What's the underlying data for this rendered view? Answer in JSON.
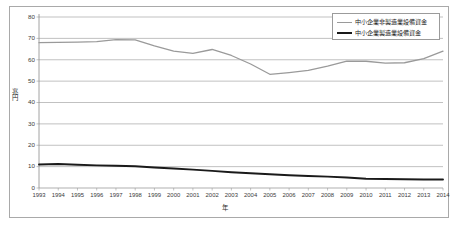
{
  "chart_data": {
    "type": "line",
    "title": "",
    "xlabel": "年",
    "ylabel": "兆円",
    "ylim": [
      0,
      80
    ],
    "ytick_step": 10,
    "yticks": [
      0,
      10,
      20,
      30,
      40,
      50,
      60,
      70,
      80
    ],
    "grid": true,
    "legend_position": "top-right",
    "categories": [
      "1993",
      "1994",
      "1995",
      "1996",
      "1997",
      "1998",
      "1999",
      "2000",
      "2001",
      "2002",
      "2003",
      "2004",
      "2005",
      "2006",
      "2007",
      "2008",
      "2009",
      "2010",
      "2011",
      "2012",
      "2013",
      "2014"
    ],
    "series": [
      {
        "name": "中小企業非製造業設備資金",
        "color": "#9a9a9a",
        "values": [
          68.0,
          68.1,
          68.2,
          68.5,
          69.4,
          69.3,
          66.5,
          64.0,
          63.0,
          64.8,
          62.0,
          58.0,
          53.2,
          54.0,
          55.0,
          57.0,
          59.4,
          59.3,
          58.4,
          58.6,
          60.5,
          64.0
        ]
      },
      {
        "name": "中小企業製造業設備資金",
        "color": "#1a1a1a",
        "values": [
          11.0,
          11.2,
          10.9,
          10.6,
          10.4,
          10.2,
          9.6,
          9.1,
          8.6,
          8.0,
          7.4,
          6.9,
          6.4,
          6.0,
          5.6,
          5.3,
          4.9,
          4.3,
          4.2,
          4.1,
          4.0,
          4.0
        ]
      }
    ]
  },
  "legend": {
    "entries": [
      {
        "label": "中小企業非製造業設備資金"
      },
      {
        "label": "中小企業製造業設備資金"
      }
    ]
  },
  "axes": {
    "y_title": "兆円",
    "x_title": "年"
  }
}
